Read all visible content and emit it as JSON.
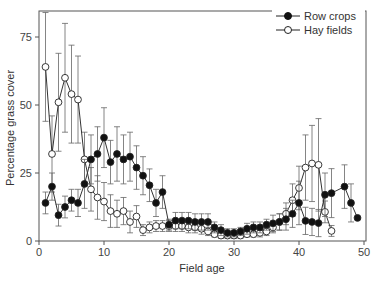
{
  "chart_data": {
    "type": "line",
    "title": "",
    "xlabel": "Field age",
    "ylabel": "Percentage grass cover",
    "xlim": [
      0,
      50
    ],
    "ylim": [
      0,
      85
    ],
    "xticks": [
      0,
      10,
      20,
      30,
      40,
      50
    ],
    "yticks": [
      0,
      25,
      50,
      75
    ],
    "grid": false,
    "legend_position": "upper right",
    "series": [
      {
        "name": "Row crops",
        "marker": "filled-circle",
        "color": "#111111",
        "x": [
          1,
          2,
          3,
          4,
          5,
          6,
          7,
          8,
          9,
          10,
          11,
          12,
          13,
          14,
          15,
          16,
          17,
          18,
          19,
          20,
          21,
          22,
          23,
          24,
          25,
          26,
          27,
          28,
          29,
          30,
          31,
          32,
          33,
          34,
          35,
          36,
          37,
          38,
          39,
          40,
          41,
          42,
          43,
          44,
          45,
          47,
          48,
          49
        ],
        "y": [
          14,
          20,
          9.5,
          12.5,
          15,
          14,
          21,
          30,
          32,
          38,
          29,
          32,
          30,
          31,
          27,
          24,
          20.5,
          14,
          18,
          6,
          7.5,
          7.5,
          7.5,
          7,
          7,
          7,
          5,
          4,
          3,
          3,
          3.5,
          4.5,
          5,
          5,
          6,
          6.5,
          7,
          8,
          10,
          14,
          7.4,
          7,
          6.6,
          17,
          17.6,
          20,
          14,
          8.5
        ],
        "err": [
          4,
          5,
          4,
          4,
          4,
          5,
          9,
          9,
          10,
          11,
          8,
          10,
          9,
          9,
          8,
          7,
          6,
          5,
          6,
          2,
          3,
          3,
          3,
          3,
          3,
          3,
          2,
          2,
          1.5,
          1.5,
          1.5,
          2,
          2,
          2,
          2,
          3,
          3,
          4,
          5,
          8,
          5,
          5,
          5,
          8,
          9,
          8,
          7,
          0
        ]
      },
      {
        "name": "Hay fields",
        "marker": "open-circle",
        "color": "#111111",
        "x": [
          1,
          2,
          3,
          4,
          5,
          6,
          7,
          8,
          9,
          10,
          11,
          12,
          13,
          14,
          15,
          16,
          17,
          18,
          19,
          20,
          21,
          22,
          23,
          24,
          25,
          26,
          27,
          28,
          29,
          30,
          31,
          32,
          33,
          34,
          35,
          36,
          37,
          38,
          39,
          40,
          41,
          42,
          43,
          44,
          45
        ],
        "y": [
          64,
          32,
          51,
          60,
          54,
          52,
          30,
          19,
          16,
          14.5,
          11,
          10,
          11,
          7,
          9,
          4,
          5,
          5.5,
          5.5,
          5.5,
          5.5,
          5.5,
          5,
          5,
          4.5,
          3.5,
          2.5,
          2,
          2,
          2,
          2,
          2.5,
          2.5,
          3,
          3.5,
          5,
          7,
          10,
          15,
          19.5,
          27,
          28.5,
          28,
          10.7,
          3.7
        ],
        "err": [
          20,
          14,
          18,
          20,
          18,
          16,
          10,
          8,
          8,
          7,
          6,
          5,
          5,
          4,
          4,
          2,
          2,
          2,
          2,
          2,
          2,
          2,
          2,
          2,
          2,
          1.5,
          1,
          1,
          1,
          1,
          1,
          1,
          1,
          1.5,
          1.5,
          2,
          3,
          4,
          6,
          8,
          12,
          14,
          17,
          4,
          2
        ]
      }
    ],
    "legend": [
      "Row crops",
      "Hay fields"
    ]
  }
}
